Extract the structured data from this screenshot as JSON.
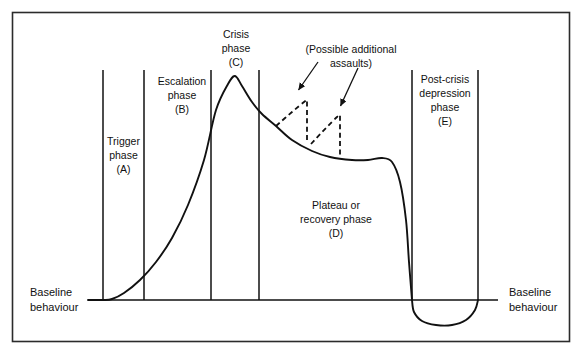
{
  "figure": {
    "frame": {
      "border_color": "#2b2b2b",
      "background": "#ffffff"
    },
    "line_color": "#111111",
    "text_color": "#111111"
  },
  "axis": {
    "baseline_left_label_line1": "Baseline",
    "baseline_left_label_line2": "behaviour",
    "baseline_right_label_line1": "Baseline",
    "baseline_right_label_line2": "behaviour"
  },
  "phases": [
    {
      "key": "trigger",
      "line1": "Trigger",
      "line2": "phase",
      "line3": "(A)"
    },
    {
      "key": "escalation",
      "line1": "Escalation",
      "line2": "phase",
      "line3": "(B)"
    },
    {
      "key": "crisis",
      "line1": "Crisis",
      "line2": "phase",
      "line3": "(C)"
    },
    {
      "key": "plateau",
      "line1": "Plateau or",
      "line2": "recovery phase",
      "line3": "(D)"
    },
    {
      "key": "post-crisis",
      "line1": "Post-crisis",
      "line2": "depression",
      "line3": "phase",
      "line4": "(E)"
    }
  ],
  "annotations": {
    "assaults_line1": "(Possible additional",
    "assaults_line2": "assaults)"
  },
  "chart_data": {
    "type": "line",
    "xlabel": "",
    "ylabel": "",
    "grid": false,
    "legend": "none",
    "baseline_y": 300,
    "xlim": [
      88,
      498
    ],
    "phase_boundaries_x": [
      103,
      144,
      211,
      259,
      412,
      478
    ],
    "series": [
      {
        "name": "Assault cycle",
        "style": "solid",
        "points": [
          [
            88,
            300
          ],
          [
            103,
            300
          ],
          [
            112,
            299
          ],
          [
            124,
            293
          ],
          [
            140,
            280
          ],
          [
            156,
            262
          ],
          [
            172,
            238
          ],
          [
            188,
            205
          ],
          [
            204,
            160
          ],
          [
            216,
            110
          ],
          [
            228,
            84
          ],
          [
            235,
            76
          ],
          [
            242,
            86
          ],
          [
            252,
            102
          ],
          [
            262,
            114
          ],
          [
            276,
            126
          ],
          [
            292,
            140
          ],
          [
            312,
            151
          ],
          [
            330,
            157
          ],
          [
            352,
            160
          ],
          [
            368,
            160
          ],
          [
            382,
            158
          ],
          [
            392,
            162
          ],
          [
            400,
            182
          ],
          [
            406,
            220
          ],
          [
            409,
            262
          ],
          [
            412,
            300
          ]
        ]
      },
      {
        "name": "Post-crisis depression dip",
        "style": "solid",
        "points": [
          [
            412,
            300
          ],
          [
            414,
            312
          ],
          [
            422,
            321
          ],
          [
            436,
            325
          ],
          [
            452,
            325
          ],
          [
            466,
            320
          ],
          [
            475,
            310
          ],
          [
            478,
            300
          ]
        ]
      },
      {
        "name": "Post-crisis return",
        "style": "solid",
        "points": [
          [
            478,
            300
          ],
          [
            498,
            300
          ]
        ]
      },
      {
        "name": "Additional assault 1",
        "style": "dashed",
        "points": [
          [
            276,
            126
          ],
          [
            292,
            112
          ],
          [
            304,
            102
          ],
          [
            307,
            100
          ],
          [
            307,
            140
          ]
        ]
      },
      {
        "name": "Additional assault 2",
        "style": "dashed",
        "points": [
          [
            311,
            144
          ],
          [
            326,
            128
          ],
          [
            337,
            117
          ],
          [
            340,
            115
          ],
          [
            340,
            156
          ]
        ]
      }
    ],
    "arrows": [
      {
        "name": "assault-1-arrow",
        "from": [
          318,
          62
        ],
        "to": [
          297,
          92
        ]
      },
      {
        "name": "assault-2-arrow",
        "from": [
          358,
          68
        ],
        "to": [
          340,
          108
        ]
      }
    ]
  }
}
